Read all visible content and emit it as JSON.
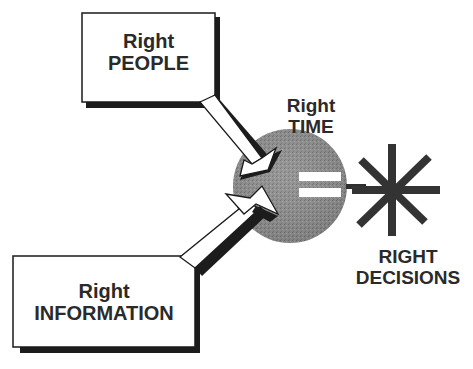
{
  "diagram": {
    "type": "concept-equation",
    "inputs": [
      {
        "id": "people",
        "line1": "Right",
        "line2": "PEOPLE"
      },
      {
        "id": "information",
        "line1": "Right",
        "line2": "INFORMATION"
      }
    ],
    "hub": {
      "line1": "Right",
      "line2": "TIME",
      "operator": "="
    },
    "output": {
      "line1": "RIGHT",
      "line2": "DECISIONS",
      "symbol": "asterisk"
    },
    "colors": {
      "text": "#2a2a2a",
      "outline": "#1a1a1a",
      "shadow": "#1c1c1c",
      "circle_fill": "#8c8c8c",
      "asterisk": "#333333",
      "box_fill": "#ffffff"
    }
  }
}
